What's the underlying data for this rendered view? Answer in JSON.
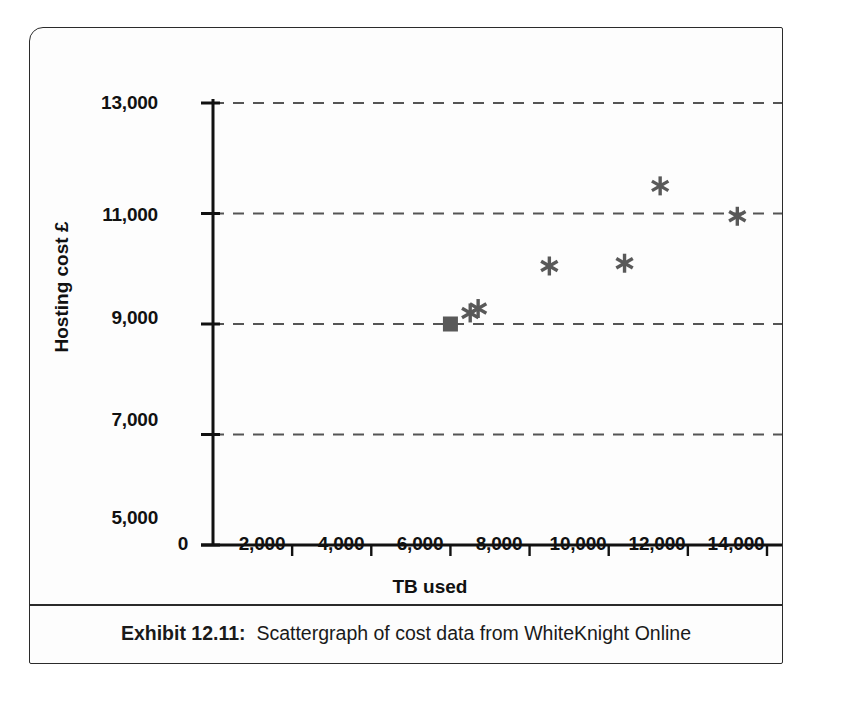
{
  "caption": {
    "label": "Exhibit 12.11:",
    "text": "Scattergraph of cost data from WhiteKnight Online"
  },
  "colors": {
    "frame": "#2b2b2b",
    "axis": "#111111",
    "gridline": "#555555",
    "marker": "#595959",
    "background": "#fdfdfd"
  },
  "chart_data": {
    "type": "scatter",
    "title": "Scattergraph of cost data from WhiteKnight Online",
    "xlabel": "TB used",
    "ylabel": "Hosting cost £",
    "xlim": [
      0,
      15600
    ],
    "ylim": [
      5000,
      13000
    ],
    "xticks": [
      0,
      2000,
      4000,
      6000,
      8000,
      10000,
      12000,
      14000
    ],
    "xtick_labels": [
      "0",
      "2,000",
      "4,000",
      "6,000",
      "8,000",
      "10,000",
      "12,000",
      "14,000"
    ],
    "yticks": [
      5000,
      7000,
      9000,
      11000,
      13000
    ],
    "ytick_labels": [
      "5,000",
      "7,000",
      "9,000",
      "11,000",
      "13,000"
    ],
    "grid": "horizontal-dashed",
    "legend": "none",
    "series": [
      {
        "name": "square-markers",
        "marker": "square",
        "points": [
          {
            "x": 6000,
            "y": 9000
          },
          {
            "x": 15000,
            "y": 11950
          }
        ]
      },
      {
        "name": "asterisk-markers",
        "marker": "asterisk",
        "points": [
          {
            "x": 6500,
            "y": 9200
          },
          {
            "x": 6700,
            "y": 9280
          },
          {
            "x": 8500,
            "y": 10050
          },
          {
            "x": 10400,
            "y": 10100
          },
          {
            "x": 11300,
            "y": 11500
          },
          {
            "x": 13250,
            "y": 10950
          },
          {
            "x": 14800,
            "y": 11400
          }
        ]
      }
    ]
  }
}
